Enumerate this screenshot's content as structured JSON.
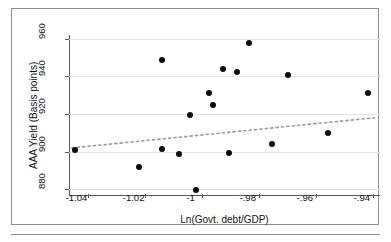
{
  "chart_data": {
    "type": "scatter",
    "title": "",
    "xlabel": "Ln(Govt. debt/GDP)",
    "ylabel": "AAA Yield (Basis points)",
    "xlim": [
      -1.0465,
      -0.9375
    ],
    "ylim": [
      877.5,
      962.0
    ],
    "xticks": [
      -1.04,
      -1.02,
      -1,
      -0.98,
      -0.96,
      -0.94
    ],
    "xticklabels": [
      "-1.04",
      "-1.02",
      "-1",
      "-.98",
      "-.96",
      "-.94"
    ],
    "yticks": [
      880,
      900,
      920,
      940,
      960
    ],
    "yticklabels": [
      "880",
      "900",
      "920",
      "940",
      "960"
    ],
    "grid": "horizontal",
    "legend": "none",
    "marker_color": "#0d0d0d",
    "grid_color": "#e2e2e2",
    "axis_color": "#5a5a5a",
    "points": [
      {
        "x": -1.0443,
        "y": 901.0
      },
      {
        "x": -1.0218,
        "y": 892.0
      },
      {
        "x": -1.0138,
        "y": 948.5
      },
      {
        "x": -1.0138,
        "y": 901.5
      },
      {
        "x": -1.0078,
        "y": 898.5
      },
      {
        "x": -1.0042,
        "y": 919.5
      },
      {
        "x": -1.0021,
        "y": 879.5
      },
      {
        "x": -0.9976,
        "y": 931.0
      },
      {
        "x": -0.9962,
        "y": 925.0
      },
      {
        "x": -0.9924,
        "y": 944.0
      },
      {
        "x": -0.9903,
        "y": 899.5
      },
      {
        "x": -0.9876,
        "y": 942.5
      },
      {
        "x": -0.9834,
        "y": 957.5
      },
      {
        "x": -0.9754,
        "y": 904.0
      },
      {
        "x": -0.9699,
        "y": 941.0
      },
      {
        "x": -0.9557,
        "y": 910.0
      },
      {
        "x": -0.9418,
        "y": 931.0
      }
    ],
    "trendline": {
      "style": "dotted",
      "color": "#9a9a9a",
      "x0": -1.0455,
      "y0": 902.0,
      "x1": -0.9395,
      "y1": 918.0
    }
  },
  "icons": {
    "figure_frame": "rectangle-frame",
    "bottom_rule": "horizontal-rule"
  }
}
